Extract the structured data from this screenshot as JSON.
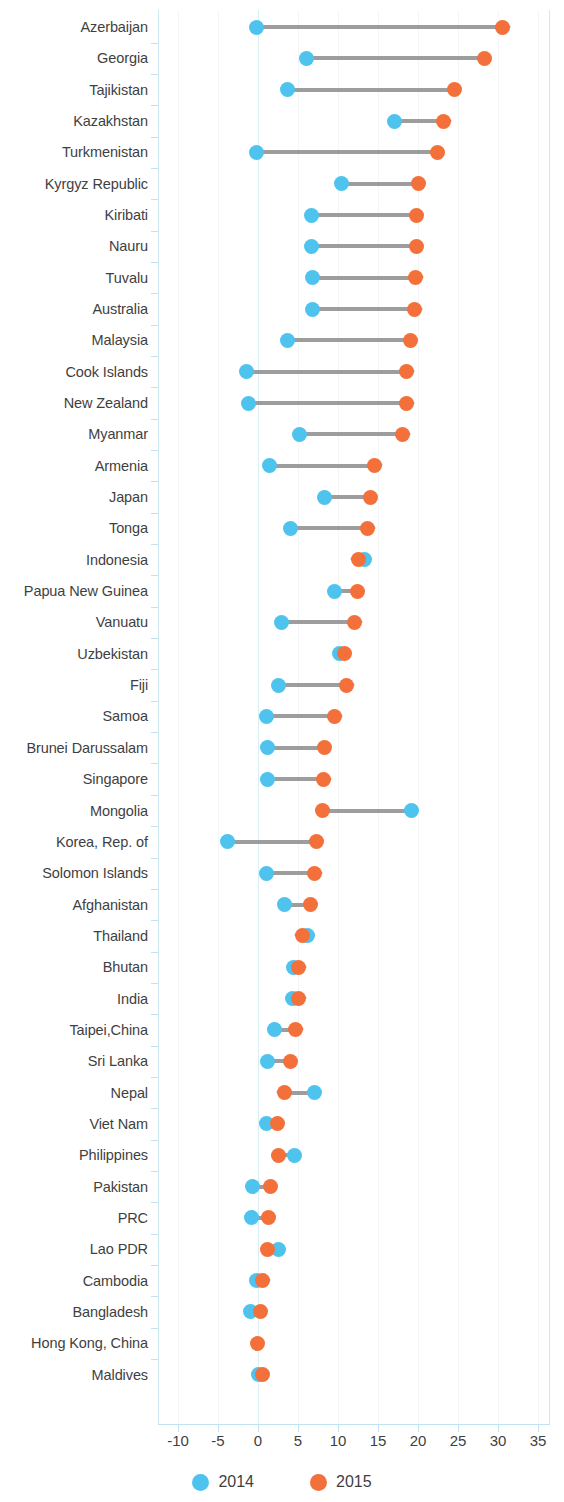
{
  "chart_data": {
    "type": "scatter",
    "subtype": "dumbbell-arrow-plot",
    "title": "",
    "xlabel": "",
    "ylabel": "",
    "xlim": [
      -12.5,
      36.5
    ],
    "xticks": [
      -10,
      -5,
      0,
      5,
      10,
      15,
      20,
      25,
      30,
      35
    ],
    "xtick_labels": [
      "-10",
      "-5",
      "0",
      "5",
      "10",
      "15",
      "20",
      "25",
      "30",
      "35"
    ],
    "grid": true,
    "legend_position": "bottom-center",
    "series": [
      {
        "name": "2014",
        "color": "#4ec3ed"
      },
      {
        "name": "2015",
        "color": "#f4703a"
      }
    ],
    "categories": [
      "Azerbaijan",
      "Georgia",
      "Tajikistan",
      "Kazakhstan",
      "Turkmenistan",
      "Kyrgyz Republic",
      "Kiribati",
      "Nauru",
      "Tuvalu",
      "Australia",
      "Malaysia",
      "Cook Islands",
      "New Zealand",
      "Myanmar",
      "Armenia",
      "Japan",
      "Tonga",
      "Indonesia",
      "Papua New Guinea",
      "Vanuatu",
      "Uzbekistan",
      "Fiji",
      "Samoa",
      "Brunei Darussalam",
      "Singapore",
      "Mongolia",
      "Korea, Rep. of",
      "Solomon Islands",
      "Afghanistan",
      "Thailand",
      "Bhutan",
      "India",
      "Taipei,China",
      "Sri Lanka",
      "Nepal",
      "Viet Nam",
      "Philippines",
      "Pakistan",
      "PRC",
      "Lao PDR",
      "Cambodia",
      "Bangladesh",
      "Hong Kong, China",
      "Maldives"
    ],
    "values_2014": [
      -0.2,
      6.1,
      3.7,
      17.1,
      -0.2,
      10.4,
      6.7,
      6.7,
      6.8,
      6.8,
      3.7,
      -1.4,
      -1.2,
      5.2,
      1.4,
      8.3,
      4.1,
      13.3,
      9.5,
      2.9,
      10.2,
      2.6,
      1.0,
      1.2,
      1.2,
      19.2,
      -3.8,
      1.0,
      3.3,
      6.2,
      4.4,
      4.3,
      2.1,
      1.2,
      7.0,
      1.0,
      4.6,
      -0.7,
      -0.8,
      2.6,
      -0.2,
      -0.9,
      null,
      0.1
    ],
    "values_2015": [
      30.6,
      28.3,
      24.5,
      23.2,
      22.4,
      20.0,
      19.8,
      19.8,
      19.7,
      19.6,
      19.0,
      18.6,
      18.6,
      18.1,
      14.6,
      14.0,
      13.7,
      12.5,
      12.4,
      12.1,
      10.8,
      11.1,
      9.6,
      8.3,
      8.2,
      8.1,
      7.3,
      7.1,
      6.5,
      5.5,
      5.1,
      5.1,
      4.7,
      4.0,
      3.3,
      2.4,
      2.6,
      1.5,
      1.3,
      1.2,
      0.6,
      0.3,
      -0.1,
      0.5
    ]
  },
  "legend": {
    "items": [
      {
        "label": "2014",
        "color": "#4ec3ed",
        "swatch_name": "legend-swatch-2014"
      },
      {
        "label": "2015",
        "color": "#f4703a",
        "swatch_name": "legend-swatch-2015"
      }
    ]
  },
  "colors": {
    "series_2014": "#4ec3ed",
    "series_2015": "#f4703a",
    "connector": "#8c8c8c",
    "axis": "#bfe3f0",
    "gridline": "#f2f6f8",
    "text": "#3f3f3f"
  }
}
